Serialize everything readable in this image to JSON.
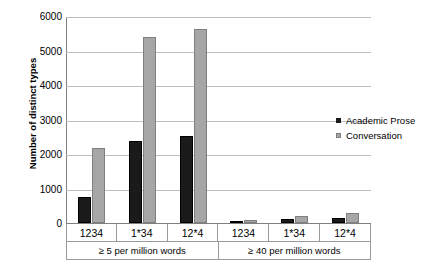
{
  "chart_data": {
    "type": "bar",
    "title": "",
    "xlabel": "",
    "ylabel": "Number of distinct types",
    "ylim": [
      0,
      6000
    ],
    "yticks": [
      0,
      1000,
      2000,
      3000,
      4000,
      5000,
      6000
    ],
    "ytick_labels": [
      "0",
      "1000",
      "2000",
      "3000",
      "4000",
      "5000",
      "6000"
    ],
    "grid": true,
    "legend_position": "right",
    "categories": [
      "1234",
      "1*34",
      "12*4",
      "1234",
      "1*34",
      "12*4"
    ],
    "groups": [
      {
        "label": "≥ 5 per million words",
        "categories": [
          "1234",
          "1*34",
          "12*4"
        ]
      },
      {
        "label": "≥ 40 per million words",
        "categories": [
          "1234",
          "1*34",
          "12*4"
        ]
      }
    ],
    "series": [
      {
        "name": "Academic Prose",
        "color": "#1a1a1a",
        "values": [
          740,
          2370,
          2520,
          40,
          130,
          150
        ]
      },
      {
        "name": "Conversation",
        "color": "#a6a6a6",
        "values": [
          2170,
          5400,
          5620,
          90,
          210,
          280
        ]
      }
    ]
  },
  "legend": {
    "items": [
      {
        "label": "Academic Prose",
        "swatch": "academic"
      },
      {
        "label": "Conversation",
        "swatch": "conversation"
      }
    ]
  }
}
